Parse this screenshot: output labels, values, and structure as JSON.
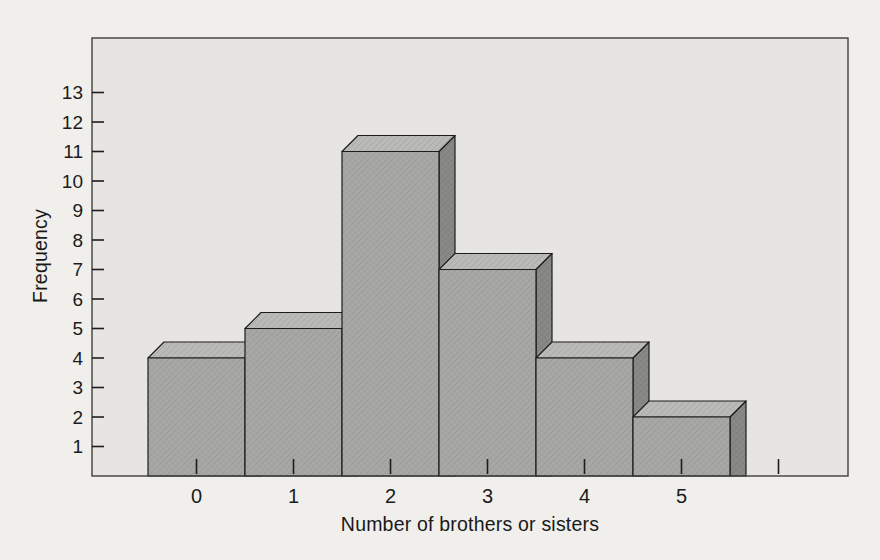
{
  "chart_data": {
    "type": "bar",
    "variant": "3d-histogram",
    "title": "",
    "xlabel": "Number of brothers or sisters",
    "ylabel": "Frequency",
    "categories": [
      "0",
      "1",
      "2",
      "3",
      "4",
      "5"
    ],
    "values": [
      4,
      5,
      11,
      7,
      4,
      2
    ],
    "ylim": [
      0,
      13
    ],
    "yticks": [
      1,
      2,
      3,
      4,
      5,
      6,
      7,
      8,
      9,
      10,
      11,
      12,
      13
    ],
    "x_tick_count": 7,
    "grid": false,
    "legend": "none",
    "bars_contiguous": true,
    "colors": {
      "page_bg": "#f0efec",
      "plot_bg": "#e6e5e2",
      "bar_front": "#a6a6a3",
      "bar_top": "#b9b9b6",
      "bar_side": "#878784",
      "outline": "#1d1d1d",
      "frame": "#3f3f3d",
      "text": "#1b1b1b"
    }
  }
}
